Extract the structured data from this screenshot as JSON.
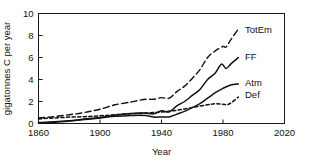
{
  "chart_data": {
    "type": "line",
    "title": "",
    "xlabel": "Year",
    "ylabel": "gigatonnes C per year",
    "xlim": [
      1860,
      2020
    ],
    "ylim": [
      0,
      10
    ],
    "xticks": [
      1860,
      1900,
      1940,
      1980,
      2020
    ],
    "yticks": [
      0,
      2,
      4,
      6,
      8,
      10
    ],
    "grid": false,
    "legend_position": "inline-right",
    "series": [
      {
        "name": "TotEm",
        "label": "TotEm",
        "style": "dashed",
        "x": [
          1860,
          1870,
          1880,
          1890,
          1900,
          1910,
          1920,
          1925,
          1930,
          1935,
          1940,
          1945,
          1950,
          1955,
          1960,
          1965,
          1970,
          1975,
          1980,
          1982,
          1985,
          1990
        ],
        "values": [
          0.5,
          0.62,
          0.8,
          1.0,
          1.3,
          1.7,
          1.95,
          2.1,
          2.2,
          2.2,
          2.35,
          2.3,
          2.9,
          3.4,
          4.1,
          4.9,
          6.0,
          6.6,
          7.0,
          6.95,
          7.6,
          8.6
        ]
      },
      {
        "name": "FF",
        "label": "FF",
        "style": "solid",
        "x": [
          1860,
          1870,
          1880,
          1890,
          1900,
          1910,
          1920,
          1925,
          1930,
          1935,
          1940,
          1945,
          1950,
          1955,
          1960,
          1965,
          1970,
          1975,
          1979,
          1982,
          1985,
          1990
        ],
        "values": [
          0.08,
          0.15,
          0.25,
          0.4,
          0.55,
          0.75,
          0.9,
          0.95,
          0.95,
          0.88,
          1.15,
          1.05,
          1.6,
          2.0,
          2.55,
          3.1,
          4.0,
          4.6,
          5.4,
          5.0,
          5.4,
          6.0
        ]
      },
      {
        "name": "Atm",
        "label": "Atm",
        "style": "solid",
        "x": [
          1860,
          1870,
          1880,
          1890,
          1900,
          1910,
          1920,
          1925,
          1930,
          1935,
          1940,
          1945,
          1950,
          1955,
          1960,
          1965,
          1970,
          1975,
          1980,
          1985,
          1990
        ],
        "values": [
          0.02,
          0.1,
          0.22,
          0.36,
          0.5,
          0.65,
          0.72,
          0.75,
          0.72,
          0.58,
          0.6,
          0.6,
          0.85,
          1.1,
          1.45,
          1.8,
          2.3,
          2.8,
          3.2,
          3.5,
          3.6
        ]
      },
      {
        "name": "Def",
        "label": "Def",
        "style": "dotted",
        "x": [
          1860,
          1870,
          1880,
          1890,
          1900,
          1910,
          1920,
          1930,
          1940,
          1950,
          1960,
          1970,
          1975,
          1980,
          1983,
          1986,
          1990
        ],
        "values": [
          0.42,
          0.5,
          0.58,
          0.62,
          0.7,
          0.8,
          0.88,
          0.95,
          1.05,
          1.2,
          1.45,
          1.7,
          1.8,
          1.75,
          1.72,
          1.95,
          2.4
        ]
      }
    ],
    "series_label_positions": [
      {
        "name": "TotEm",
        "x": 1993,
        "y": 8.55
      },
      {
        "name": "FF",
        "x": 1993,
        "y": 6.05
      },
      {
        "name": "Atm",
        "x": 1993,
        "y": 3.75
      },
      {
        "name": "Def",
        "x": 1993,
        "y": 2.6
      }
    ]
  }
}
